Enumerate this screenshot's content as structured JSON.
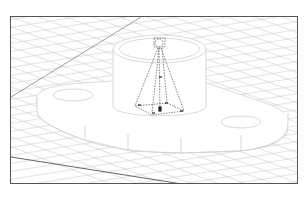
{
  "scene": {
    "type": "cad-isometric-viewport",
    "colors": {
      "frame": "#555555",
      "grid": "#c8c8c8",
      "grid_strong": "#666666",
      "model_edge": "#cfcfcf",
      "model_fill": "#ffffff",
      "light_gizmo": "#333333"
    },
    "objects": [
      {
        "name": "ground-grid"
      },
      {
        "name": "flange-base-plate",
        "holes": 2
      },
      {
        "name": "cylinder-boss"
      },
      {
        "name": "spotlight-gizmo",
        "shape": "pyramid-frustum"
      }
    ]
  }
}
